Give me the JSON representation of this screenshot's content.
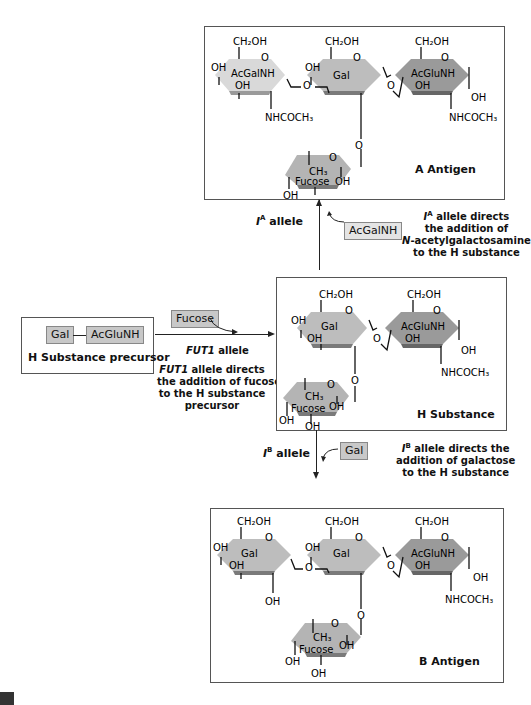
{
  "colors": {
    "acgalnh_fill": "#d9d9d9",
    "gal_fill": "#bdbdbd",
    "acglunh_fill": "#9a9a9a",
    "fucose_fill": "#b4b4b4",
    "edge_shade": "#7a7a7a",
    "tag_fill": "#c8c8c8"
  },
  "a_antigen": {
    "title": "A Antigen",
    "sugars": [
      "AcGalNH",
      "Gal",
      "AcGluNH",
      "Fucose"
    ]
  },
  "h_substance": {
    "title": "H Substance",
    "sugars": [
      "Gal",
      "AcGluNH",
      "Fucose"
    ]
  },
  "b_antigen": {
    "title": "B Antigen",
    "sugars": [
      "Gal",
      "Gal",
      "AcGluNH",
      "Fucose"
    ]
  },
  "precursor": {
    "title": "H Substance precursor",
    "sugar_left": "Gal",
    "sugar_right": "AcGluNH"
  },
  "fut1_step": {
    "added_sugar": "Fucose",
    "allele_label": "FUT1",
    "allele_suffix": " allele",
    "note_line1_ital": "FUT1",
    "note_line1_rest": " allele directs",
    "note_line2": "the addition of fucose",
    "note_line3": "to the H substance",
    "note_line4": "precursor"
  },
  "ia_step": {
    "allele_base": "I",
    "allele_sup": "A",
    "allele_suffix": " allele",
    "added_sugar": "AcGalNH",
    "note_line1_base": "I",
    "note_line1_sup": "A",
    "note_line1_rest": " allele directs",
    "note_line2": "the addition of",
    "note_line3_ital": "N",
    "note_line3_rest": "-acetylgalactosamine",
    "note_line4": "to the H substance"
  },
  "ib_step": {
    "allele_base": "I",
    "allele_sup": "B",
    "allele_suffix": " allele",
    "added_sugar": "Gal",
    "note_line1_base": "I",
    "note_line1_sup": "B",
    "note_line1_rest": " allele directs the",
    "note_line2": "addition of galactose",
    "note_line3": "to the H substance"
  },
  "chem": {
    "ch2oh": "CH₂OH",
    "oh": "OH",
    "o": "O",
    "nhcoch3": "NHCOCH₃",
    "ch3": "CH₃"
  }
}
